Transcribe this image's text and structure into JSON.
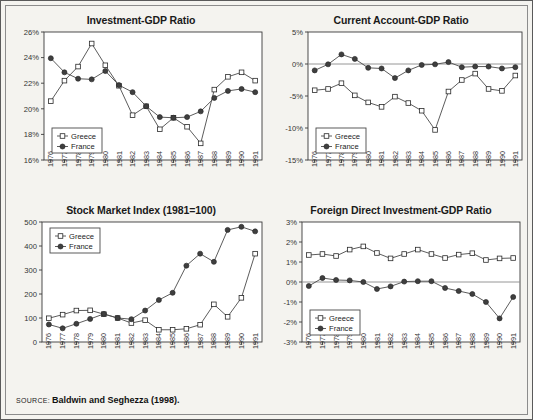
{
  "figure": {
    "background_color": "#f4f3ef",
    "border_color": "#5a5a5a",
    "source_label": "SOURCE:",
    "source_text": "Baldwin and Seghezza (1998)."
  },
  "series_colors": {
    "greece": "#ffffff",
    "france": "#3f3f3f",
    "line": "#4a4a4a"
  },
  "legend": {
    "greece_label": "Greece",
    "france_label": "France"
  },
  "chart_data": [
    {
      "type": "line",
      "panel_index": 0,
      "title": "Investment-GDP Ratio",
      "xlabel": "",
      "ylabel": "",
      "x": [
        1976,
        1977,
        1978,
        1979,
        1980,
        1981,
        1982,
        1983,
        1984,
        1985,
        1986,
        1987,
        1988,
        1989,
        1990,
        1991
      ],
      "xticklabels": [
        "1976",
        "1977",
        "1978",
        "1979",
        "1980",
        "1981",
        "1982",
        "1983",
        "1984",
        "1985",
        "1986",
        "1987",
        "1988",
        "1989",
        "1990",
        "1991"
      ],
      "ylim": [
        16,
        26
      ],
      "yticks": [
        16,
        18,
        20,
        22,
        24,
        26
      ],
      "yticklabels": [
        "16%",
        "18%",
        "20%",
        "22%",
        "24%",
        "26%"
      ],
      "grid": false,
      "legend_position": "lower-left",
      "series": [
        {
          "name": "Greece",
          "marker": "open-square",
          "values": [
            20.6,
            22.2,
            23.3,
            25.1,
            23.4,
            21.8,
            19.5,
            20.2,
            18.4,
            19.3,
            18.6,
            17.3,
            21.5,
            22.5,
            22.85,
            22.2
          ]
        },
        {
          "name": "France",
          "marker": "filled-circle",
          "values": [
            23.95,
            22.85,
            22.35,
            22.3,
            22.95,
            21.85,
            21.3,
            20.2,
            19.35,
            19.3,
            19.35,
            19.8,
            20.85,
            21.4,
            21.55,
            21.3
          ]
        }
      ]
    },
    {
      "type": "line",
      "panel_index": 1,
      "title": "Current Account-GDP Ratio",
      "xlabel": "",
      "ylabel": "",
      "x": [
        1976,
        1977,
        1978,
        1979,
        1980,
        1981,
        1982,
        1983,
        1984,
        1985,
        1986,
        1987,
        1988,
        1989,
        1990,
        1991
      ],
      "xticklabels": [
        "1976",
        "1977",
        "1978",
        "1979",
        "1980",
        "1981",
        "1982",
        "1983",
        "1984",
        "1985",
        "1986",
        "1987",
        "1988",
        "1989",
        "1990",
        "1991"
      ],
      "ylim": [
        -15,
        5
      ],
      "yticks": [
        -15,
        -10,
        -5,
        0,
        5
      ],
      "yticklabels": [
        "-15%",
        "-10%",
        "-5%",
        "0%",
        "5%"
      ],
      "grid": false,
      "zeroline": true,
      "legend_position": "lower-left",
      "series": [
        {
          "name": "Greece",
          "marker": "open-square",
          "values": [
            -4.1,
            -3.9,
            -3.0,
            -4.9,
            -6.0,
            -6.7,
            -5.1,
            -6.1,
            -7.3,
            -10.3,
            -4.3,
            -2.5,
            -1.5,
            -3.9,
            -4.2,
            -1.8
          ]
        },
        {
          "name": "France",
          "marker": "filled-circle",
          "values": [
            -1.0,
            -0.05,
            1.5,
            0.8,
            -0.6,
            -0.7,
            -2.2,
            -1.0,
            -0.15,
            -0.05,
            0.3,
            -0.5,
            -0.4,
            -0.4,
            -0.7,
            -0.5
          ]
        }
      ]
    },
    {
      "type": "line",
      "panel_index": 2,
      "title": "Stock Market Index (1981=100)",
      "xlabel": "",
      "ylabel": "",
      "x": [
        1976,
        1977,
        1978,
        1979,
        1980,
        1981,
        1982,
        1983,
        1984,
        1985,
        1986,
        1987,
        1988,
        1989,
        1990,
        1991
      ],
      "xticklabels": [
        "1976",
        "1977",
        "1978",
        "1979",
        "1980",
        "1981",
        "1982",
        "1983",
        "1984",
        "1985",
        "1986",
        "1987",
        "1988",
        "1989",
        "1990",
        "1991"
      ],
      "ylim": [
        0,
        500
      ],
      "yticks": [
        0,
        100,
        200,
        300,
        400,
        500
      ],
      "yticklabels": [
        "0",
        "100",
        "200",
        "300",
        "400",
        "500"
      ],
      "grid": false,
      "legend_position": "upper-left",
      "series": [
        {
          "name": "Greece",
          "marker": "open-square",
          "values": [
            99,
            114,
            131,
            132,
            116,
            100,
            79,
            91,
            51,
            51,
            55,
            72,
            157,
            105,
            184,
            368
          ]
        },
        {
          "name": "France",
          "marker": "filled-circle",
          "values": [
            73,
            57,
            76,
            96,
            117,
            100,
            95,
            131,
            175,
            205,
            318,
            368,
            334,
            467,
            480,
            461
          ]
        }
      ]
    },
    {
      "type": "line",
      "panel_index": 3,
      "title": "Foreign Direct Investment-GDP Ratio",
      "xlabel": "",
      "ylabel": "",
      "x": [
        1976,
        1977,
        1978,
        1979,
        1980,
        1981,
        1982,
        1983,
        1984,
        1985,
        1986,
        1987,
        1988,
        1989,
        1990,
        1991
      ],
      "xticklabels": [
        "1976",
        "1977",
        "1978",
        "1979",
        "1980",
        "1981",
        "1982",
        "1983",
        "1984",
        "1985",
        "1986",
        "1987",
        "1988",
        "1989",
        "1990",
        "1991"
      ],
      "ylim": [
        -3,
        3
      ],
      "yticks": [
        -3,
        -2,
        -1,
        0,
        1,
        2,
        3
      ],
      "yticklabels": [
        "-3%",
        "-2%",
        "-1%",
        "0%",
        "1%",
        "2%",
        "3%"
      ],
      "grid": false,
      "zeroline": true,
      "legend_position": "lower-left",
      "series": [
        {
          "name": "Greece",
          "marker": "open-square",
          "values": [
            1.35,
            1.4,
            1.3,
            1.62,
            1.78,
            1.45,
            1.18,
            1.4,
            1.62,
            1.4,
            1.2,
            1.37,
            1.44,
            1.1,
            1.18,
            1.2
          ]
        },
        {
          "name": "France",
          "marker": "filled-circle",
          "values": [
            -0.2,
            0.2,
            0.1,
            0.08,
            0.0,
            -0.35,
            -0.22,
            0.02,
            0.04,
            0.04,
            -0.3,
            -0.45,
            -0.6,
            -1.0,
            -1.82,
            -0.75
          ]
        }
      ]
    }
  ]
}
